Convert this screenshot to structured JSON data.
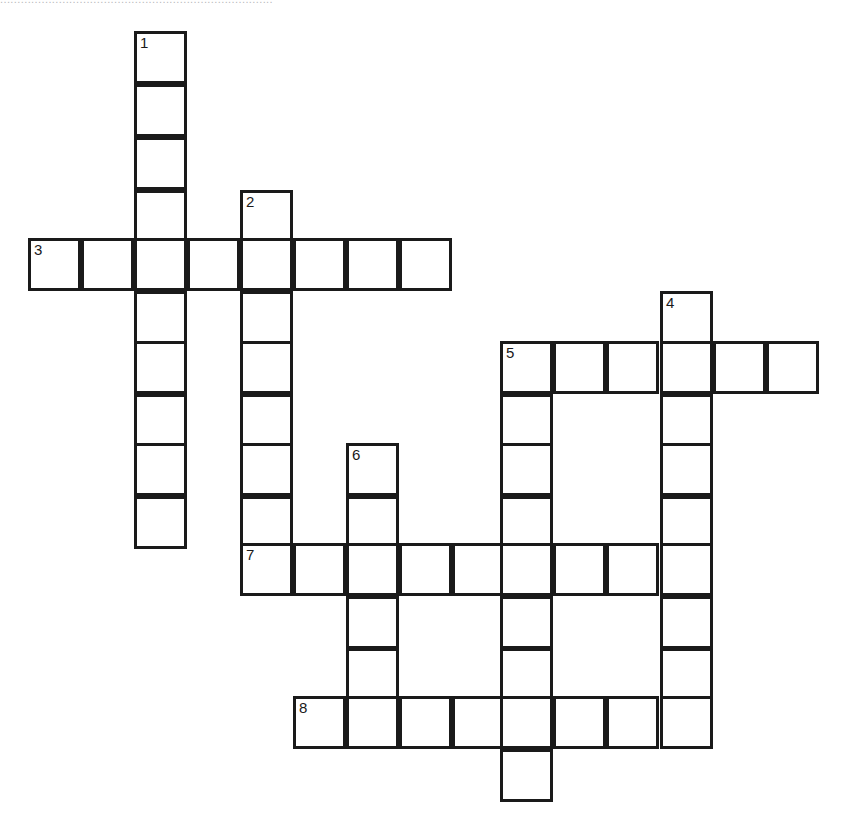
{
  "page": {
    "background_color": "#ffffff",
    "ink_color": "#1a1a1a",
    "cut_off_header_text": "..............................................................................."
  },
  "grid": {
    "cell_size_px": 53,
    "origin_x_px": 28,
    "origin_y_px": 31,
    "border_width_px": 3,
    "columns_px": [
      28,
      81,
      134,
      187,
      240,
      293,
      346,
      399,
      452,
      500,
      553,
      606,
      660,
      713,
      766
    ],
    "rows_px": [
      31,
      84,
      137,
      190,
      238,
      291,
      341,
      394,
      443,
      496,
      543,
      596,
      648,
      696,
      749
    ],
    "numbered_clue_labels": [
      "1",
      "2",
      "3",
      "4",
      "5",
      "6",
      "7",
      "8"
    ],
    "entries": [
      {
        "number": "1",
        "direction": "down",
        "length": 9,
        "start_col": 2,
        "start_row": 0
      },
      {
        "number": "2",
        "direction": "down",
        "length": 7,
        "start_col": 4,
        "start_row": 3
      },
      {
        "number": "3",
        "direction": "across",
        "length": 8,
        "start_col": 0,
        "start_row": 4
      },
      {
        "number": "4",
        "direction": "down",
        "length": 7,
        "start_col": 12,
        "start_row": 5
      },
      {
        "number": "5",
        "direction": "across",
        "length": 6,
        "start_col": 9,
        "start_row": 6
      },
      {
        "number": "5",
        "direction": "down",
        "length": 9,
        "start_col": 9,
        "start_row": 6
      },
      {
        "number": "6",
        "direction": "down",
        "length": 6,
        "start_col": 6,
        "start_row": 8
      },
      {
        "number": "7",
        "direction": "across",
        "length": 9,
        "start_col": 4,
        "start_row": 10
      },
      {
        "number": "8",
        "direction": "across",
        "length": 8,
        "start_col": 5,
        "start_row": 13
      }
    ],
    "cells": [
      {
        "col": 2,
        "row": 0,
        "number": "1"
      },
      {
        "col": 2,
        "row": 1,
        "number": ""
      },
      {
        "col": 2,
        "row": 2,
        "number": ""
      },
      {
        "col": 2,
        "row": 3,
        "number": ""
      },
      {
        "col": 2,
        "row": 5,
        "number": ""
      },
      {
        "col": 2,
        "row": 6,
        "number": ""
      },
      {
        "col": 2,
        "row": 7,
        "number": ""
      },
      {
        "col": 2,
        "row": 8,
        "number": ""
      },
      {
        "col": 2,
        "row": 9,
        "number": ""
      },
      {
        "col": 4,
        "row": 3,
        "number": "2"
      },
      {
        "col": 4,
        "row": 5,
        "number": ""
      },
      {
        "col": 4,
        "row": 6,
        "number": ""
      },
      {
        "col": 4,
        "row": 7,
        "number": ""
      },
      {
        "col": 4,
        "row": 8,
        "number": ""
      },
      {
        "col": 4,
        "row": 9,
        "number": ""
      },
      {
        "col": 0,
        "row": 4,
        "number": "3"
      },
      {
        "col": 1,
        "row": 4,
        "number": ""
      },
      {
        "col": 2,
        "row": 4,
        "number": ""
      },
      {
        "col": 3,
        "row": 4,
        "number": ""
      },
      {
        "col": 4,
        "row": 4,
        "number": ""
      },
      {
        "col": 5,
        "row": 4,
        "number": ""
      },
      {
        "col": 6,
        "row": 4,
        "number": ""
      },
      {
        "col": 7,
        "row": 4,
        "number": ""
      },
      {
        "col": 12,
        "row": 5,
        "number": "4"
      },
      {
        "col": 12,
        "row": 7,
        "number": ""
      },
      {
        "col": 12,
        "row": 8,
        "number": ""
      },
      {
        "col": 12,
        "row": 9,
        "number": ""
      },
      {
        "col": 12,
        "row": 11,
        "number": ""
      },
      {
        "col": 12,
        "row": 12,
        "number": ""
      },
      {
        "col": 9,
        "row": 6,
        "number": "5"
      },
      {
        "col": 10,
        "row": 6,
        "number": ""
      },
      {
        "col": 11,
        "row": 6,
        "number": ""
      },
      {
        "col": 12,
        "row": 6,
        "number": ""
      },
      {
        "col": 13,
        "row": 6,
        "number": ""
      },
      {
        "col": 14,
        "row": 6,
        "number": ""
      },
      {
        "col": 9,
        "row": 7,
        "number": ""
      },
      {
        "col": 9,
        "row": 8,
        "number": ""
      },
      {
        "col": 9,
        "row": 9,
        "number": ""
      },
      {
        "col": 9,
        "row": 11,
        "number": ""
      },
      {
        "col": 9,
        "row": 12,
        "number": ""
      },
      {
        "col": 9,
        "row": 14,
        "number": ""
      },
      {
        "col": 6,
        "row": 8,
        "number": "6"
      },
      {
        "col": 6,
        "row": 9,
        "number": ""
      },
      {
        "col": 6,
        "row": 11,
        "number": ""
      },
      {
        "col": 6,
        "row": 12,
        "number": ""
      },
      {
        "col": 4,
        "row": 10,
        "number": "7"
      },
      {
        "col": 5,
        "row": 10,
        "number": ""
      },
      {
        "col": 6,
        "row": 10,
        "number": ""
      },
      {
        "col": 7,
        "row": 10,
        "number": ""
      },
      {
        "col": 8,
        "row": 10,
        "number": ""
      },
      {
        "col": 9,
        "row": 10,
        "number": ""
      },
      {
        "col": 10,
        "row": 10,
        "number": ""
      },
      {
        "col": 11,
        "row": 10,
        "number": ""
      },
      {
        "col": 12,
        "row": 10,
        "number": ""
      },
      {
        "col": 5,
        "row": 13,
        "number": "8"
      },
      {
        "col": 6,
        "row": 13,
        "number": ""
      },
      {
        "col": 7,
        "row": 13,
        "number": ""
      },
      {
        "col": 8,
        "row": 13,
        "number": ""
      },
      {
        "col": 9,
        "row": 13,
        "number": ""
      },
      {
        "col": 10,
        "row": 13,
        "number": ""
      },
      {
        "col": 11,
        "row": 13,
        "number": ""
      },
      {
        "col": 12,
        "row": 13,
        "number": ""
      }
    ]
  }
}
